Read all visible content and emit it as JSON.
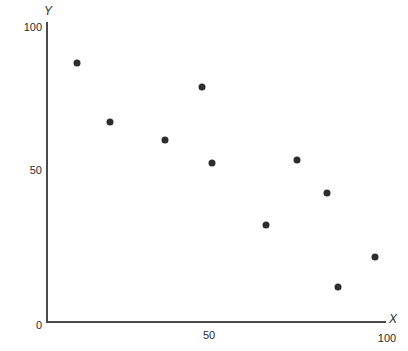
{
  "chart_data": {
    "type": "scatter",
    "title": "",
    "subtitle": "",
    "xlabel": "X",
    "ylabel": "Y",
    "xlim": [
      0,
      100
    ],
    "ylim": [
      0,
      100
    ],
    "grid": false,
    "legend": null,
    "x_ticks": [
      "50",
      "100"
    ],
    "x_tick_values": [
      50,
      100
    ],
    "y_ticks": [
      "0",
      "50",
      "100"
    ],
    "y_tick_values": [
      0,
      50,
      100
    ],
    "marker": "filled-circle",
    "marker_color": "#2d2d2d",
    "axis_color": "#4a4a4a",
    "background_color": "#ffffff",
    "points": [
      {
        "x": 9,
        "y": 88
      },
      {
        "x": 19,
        "y": 68
      },
      {
        "x": 35,
        "y": 62
      },
      {
        "x": 46,
        "y": 80
      },
      {
        "x": 49,
        "y": 54
      },
      {
        "x": 65,
        "y": 33
      },
      {
        "x": 74,
        "y": 55
      },
      {
        "x": 83,
        "y": 44
      },
      {
        "x": 86,
        "y": 12
      },
      {
        "x": 97,
        "y": 22
      }
    ],
    "x": [
      9,
      19,
      35,
      46,
      49,
      65,
      74,
      83,
      86,
      97
    ],
    "values": [
      88,
      68,
      62,
      80,
      54,
      33,
      55,
      44,
      12,
      22
    ]
  },
  "axes": {
    "y_title": "Y",
    "x_title": "X",
    "y_top_label": "100",
    "y_mid_label": "50",
    "y_zero_label": "0",
    "x_mid_label": "50",
    "x_max_label": "100"
  }
}
